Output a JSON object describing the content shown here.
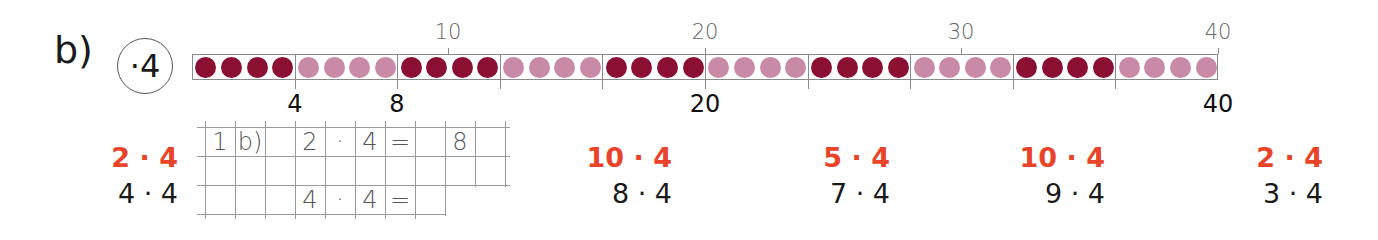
{
  "task_label": "b)",
  "operator_badge": "·4",
  "colors": {
    "bead_dark": "#8b0f33",
    "bead_light": "#c98aa8",
    "accent_red": "#e8442a",
    "line_gray": "#8a8a8a"
  },
  "bead_strip": {
    "total_beads": 40,
    "group_size": 4,
    "pattern": [
      "dark",
      "light",
      "dark",
      "light",
      "dark",
      "light",
      "dark",
      "light",
      "dark",
      "light"
    ],
    "top_ticks": [
      {
        "value": "10",
        "x": 448
      },
      {
        "value": "20",
        "x": 705
      },
      {
        "value": "30",
        "x": 961
      },
      {
        "value": "40",
        "x": 1218
      }
    ],
    "bottom_labels": [
      {
        "value": "4",
        "x": 295
      },
      {
        "value": "8",
        "x": 397
      },
      {
        "value": "20",
        "x": 705
      },
      {
        "value": "40",
        "x": 1218
      }
    ]
  },
  "tasks": [
    {
      "given": "2 · 4",
      "target": "4 · 4",
      "x": 178
    },
    {
      "given": "10 · 4",
      "target": "8 · 4",
      "x": 672
    },
    {
      "given": "5 · 4",
      "target": "7 · 4",
      "x": 890
    },
    {
      "given": "10 · 4",
      "target": "9 · 4",
      "x": 1105
    },
    {
      "given": "2 · 4",
      "target": "3 · 4",
      "x": 1323
    }
  ],
  "notebook": {
    "row1": [
      "1",
      "b)",
      "",
      "2",
      "·",
      "4",
      "=",
      "",
      "8"
    ],
    "row2": [
      "",
      "",
      "",
      "",
      "",
      "",
      "",
      "",
      ""
    ],
    "row3": [
      "",
      "",
      "",
      "4",
      "·",
      "4",
      "="
    ]
  }
}
